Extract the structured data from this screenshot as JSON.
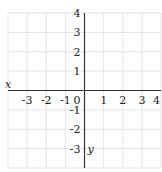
{
  "chart_data": {
    "type": "scatter",
    "title": "",
    "xlabel": "x",
    "ylabel": "y",
    "xlim": [
      -4,
      4
    ],
    "ylim": [
      -4,
      4
    ],
    "grid": true,
    "x_ticks": [
      "-3",
      "-2",
      "-1",
      "0",
      "1",
      "2",
      "3",
      "4"
    ],
    "y_ticks": [
      "4",
      "3",
      "2",
      "1",
      "-1",
      "-2",
      "-3"
    ],
    "series": [],
    "colors": {
      "grid": "#e4e4e4",
      "axis": "#333333",
      "text": "#222222"
    }
  }
}
